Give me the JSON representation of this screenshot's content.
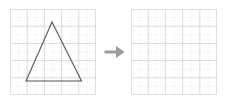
{
  "figure": {
    "name": "geometry-transformation-worksheet",
    "background_color": "#ffffff",
    "arrow": {
      "icon": "arrow-right-icon",
      "direction": "right",
      "color": "#9b9b9b"
    },
    "grid": {
      "columns": 5,
      "rows": 5,
      "minor_subdivisions": 2,
      "major_line_color": "#d8d8d8",
      "minor_line_color": "#e8e8e8",
      "border_color": "#d8d8d8",
      "cell_size_px": 17.2
    },
    "panels": [
      {
        "name": "source-grid",
        "label": "",
        "has_shape": true,
        "shape": {
          "name": "triangle",
          "type": "polygon",
          "sides": 3,
          "classification": "isosceles",
          "stroke_color": "#555555",
          "stroke_width": 1.1,
          "fill": "none",
          "vertices_px": [
            {
              "label": "apex",
              "x": 42.0,
              "y": 13.0
            },
            {
              "label": "bottom-left",
              "x": 16.0,
              "y": 72.0
            },
            {
              "label": "bottom-right",
              "x": 71.5,
              "y": 72.0
            }
          ],
          "vertices_grid": [
            {
              "label": "apex",
              "x": 2.45,
              "y": 4.25
            },
            {
              "label": "bottom-left",
              "x": 0.95,
              "y": 0.8
            },
            {
              "label": "bottom-right",
              "x": 4.15,
              "y": 0.8
            }
          ]
        }
      },
      {
        "name": "target-grid",
        "label": "",
        "has_shape": false,
        "shape": null
      }
    ]
  },
  "chart_data": {
    "type": "scatter",
    "title": "",
    "xlabel": "",
    "ylabel": "",
    "grid": true,
    "xlim": [
      0,
      5
    ],
    "ylim": [
      0,
      5
    ],
    "series": [
      {
        "name": "triangle-vertices",
        "x": [
          2.45,
          0.95,
          4.15,
          2.45
        ],
        "y": [
          4.25,
          0.8,
          0.8,
          4.25
        ]
      }
    ]
  }
}
